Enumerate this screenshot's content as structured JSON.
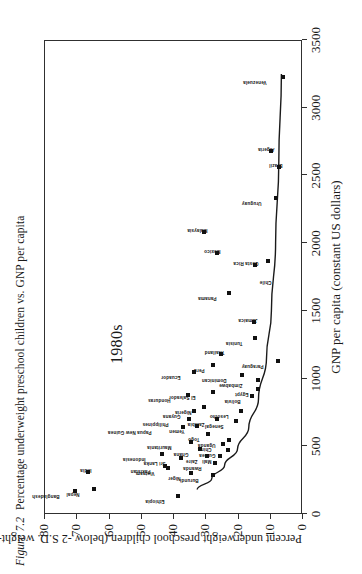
{
  "figure": {
    "number": "Figure 7.2",
    "caption": "Percentage underweight preschool children vs. GNP per capita"
  },
  "chart_data": {
    "type": "scatter",
    "title": "Percentage underweight preschool children vs. GNP per capita",
    "annotation": "1980s",
    "xlabel": "GNP per capita (constant US dollars)",
    "ylabel": "Percent underweight preschool children (below -2 S.D. weight-for-age)",
    "xlim": [
      0,
      3500
    ],
    "ylim": [
      0,
      80
    ],
    "xticks": [
      "0",
      "500",
      "1000",
      "1500",
      "2000",
      "2500",
      "3000",
      "3500"
    ],
    "yticks": [
      "0",
      "10",
      "20",
      "30",
      "40",
      "50",
      "60",
      "70",
      "80"
    ],
    "grid": false,
    "legend": "none",
    "trend_line": {
      "description": "fitted declining curve",
      "points": [
        [
          180,
          32.5
        ],
        [
          260,
          28
        ],
        [
          360,
          24
        ],
        [
          480,
          20
        ],
        [
          640,
          16.5
        ],
        [
          850,
          13.5
        ],
        [
          1150,
          11
        ],
        [
          1500,
          9.5
        ],
        [
          2000,
          8.2
        ],
        [
          2600,
          7.2
        ],
        [
          3250,
          6.4
        ]
      ]
    },
    "points": [
      {
        "name": "Bangladesh",
        "x": 170,
        "y": 70.5,
        "lx": -2,
        "ly": -20,
        "rot": -90
      },
      {
        "name": "Nepal",
        "x": 185,
        "y": 64.5,
        "lx": -2,
        "ly": -19,
        "rot": -90
      },
      {
        "name": "India",
        "x": 310,
        "y": 66.5,
        "lx": 5,
        "ly": -1,
        "rot": -90
      },
      {
        "name": "Pakistan",
        "x": 355,
        "y": 42.5,
        "lx": -2,
        "ly": -19,
        "rot": -90
      },
      {
        "name": "Indonesia",
        "x": 440,
        "y": 43.5,
        "lx": -2,
        "ly": -21,
        "rot": -90
      },
      {
        "name": "Ethiopia",
        "x": 130,
        "y": 38.5,
        "lx": -2,
        "ly": -18,
        "rot": -90
      },
      {
        "name": "Niger",
        "x": 305,
        "y": 34.5,
        "lx": -2,
        "ly": -15,
        "rot": -90
      },
      {
        "name": "Sri Lanka",
        "x": 415,
        "y": 37.5,
        "lx": -2,
        "ly": -20,
        "rot": -90
      },
      {
        "name": "Vietnam",
        "x": 340,
        "y": 41.5,
        "lx": -2,
        "ly": -18,
        "rot": -90
      },
      {
        "name": "Papua New Guinea",
        "x": 640,
        "y": 37.0,
        "lx": -2,
        "ly": -36,
        "rot": -90
      },
      {
        "name": "Philippines",
        "x": 700,
        "y": 35.0,
        "lx": -2,
        "ly": -25,
        "rot": -90
      },
      {
        "name": "Mauritania",
        "x": 530,
        "y": 34.5,
        "lx": -2,
        "ly": -24,
        "rot": -90
      },
      {
        "name": "Ghana",
        "x": 480,
        "y": 31.5,
        "lx": -2,
        "ly": -16,
        "rot": -90
      },
      {
        "name": "Zaire",
        "x": 430,
        "y": 29.5,
        "lx": -2,
        "ly": -14,
        "rot": -90
      },
      {
        "name": "Burundi",
        "x": 285,
        "y": 27.5,
        "lx": -2,
        "ly": -19,
        "rot": -90
      },
      {
        "name": "Rwanda",
        "x": 380,
        "y": 27.0,
        "lx": -2,
        "ly": -18,
        "rot": -90
      },
      {
        "name": "Mali",
        "x": 430,
        "y": 25.5,
        "lx": -2,
        "ly": -13,
        "rot": -90
      },
      {
        "name": "Guinea",
        "x": 470,
        "y": 23.0,
        "lx": -2,
        "ly": -17,
        "rot": -90
      },
      {
        "name": "China",
        "x": 520,
        "y": 24.5,
        "lx": -2,
        "ly": -16,
        "rot": -90
      },
      {
        "name": "Uganda",
        "x": 545,
        "y": 22.5,
        "lx": -2,
        "ly": -18,
        "rot": -90
      },
      {
        "name": "Yemen",
        "x": 650,
        "y": 32.5,
        "lx": -2,
        "ly": -17,
        "rot": -90
      },
      {
        "name": "Togo",
        "x": 590,
        "y": 29.0,
        "lx": -2,
        "ly": -13,
        "rot": -90
      },
      {
        "name": "Guyana",
        "x": 760,
        "y": 33.5,
        "lx": -2,
        "ly": -18,
        "rot": -90
      },
      {
        "name": "Honduras",
        "x": 880,
        "y": 35.5,
        "lx": -2,
        "ly": -22,
        "rot": -90
      },
      {
        "name": "Nigeria",
        "x": 790,
        "y": 30.5,
        "lx": -2,
        "ly": -17,
        "rot": -90
      },
      {
        "name": "Zambia",
        "x": 700,
        "y": 26.5,
        "lx": -2,
        "ly": -17,
        "rot": -90
      },
      {
        "name": "Senegal",
        "x": 690,
        "y": 20.5,
        "lx": -2,
        "ly": -17,
        "rot": -90
      },
      {
        "name": "Lesotho",
        "x": 760,
        "y": 19.0,
        "lx": -2,
        "ly": -17,
        "rot": -90
      },
      {
        "name": "El Salvador",
        "x": 900,
        "y": 27.5,
        "lx": -2,
        "ly": -22,
        "rot": -90
      },
      {
        "name": "Bolivia",
        "x": 870,
        "y": 15.5,
        "lx": -2,
        "ly": -16,
        "rot": -90
      },
      {
        "name": "Egypt",
        "x": 920,
        "y": 13.5,
        "lx": -2,
        "ly": -14,
        "rot": -90
      },
      {
        "name": "Zimbabwe",
        "x": 990,
        "y": 13.5,
        "lx": -2,
        "ly": -20,
        "rot": -90
      },
      {
        "name": "Dominican",
        "x": 1030,
        "y": 18.5,
        "lx": -2,
        "ly": -20,
        "rot": -90
      },
      {
        "name": "Ecuador",
        "x": 1050,
        "y": 33.5,
        "lx": -2,
        "ly": -18,
        "rot": -90
      },
      {
        "name": "Peru",
        "x": 1100,
        "y": 27.5,
        "lx": -2,
        "ly": -13,
        "rot": -90
      },
      {
        "name": "Thailand",
        "x": 1180,
        "y": 25.0,
        "lx": 5,
        "ly": -1,
        "rot": -90
      },
      {
        "name": "Tunisia",
        "x": 1300,
        "y": 14.5,
        "lx": -2,
        "ly": -17,
        "rot": -90
      },
      {
        "name": "Jamaica",
        "x": 1420,
        "y": 15.0,
        "lx": 5,
        "ly": -1,
        "rot": -90
      },
      {
        "name": "Paraguay",
        "x": 1130,
        "y": 7.5,
        "lx": -2,
        "ly": -19,
        "rot": -90
      },
      {
        "name": "Panama",
        "x": 1630,
        "y": 22.5,
        "lx": -2,
        "ly": -17,
        "rot": -90
      },
      {
        "name": "Costa Rica",
        "x": 1840,
        "y": 14.5,
        "lx": 5,
        "ly": -1,
        "rot": -90
      },
      {
        "name": "Chile",
        "x": 1870,
        "y": 10.5,
        "lx": -18,
        "ly": -1,
        "rot": -90
      },
      {
        "name": "Mexico",
        "x": 1930,
        "y": 26.5,
        "lx": 5,
        "ly": -1,
        "rot": -90
      },
      {
        "name": "Malaysia",
        "x": 2080,
        "y": 30.5,
        "lx": 5,
        "ly": -1,
        "rot": -90
      },
      {
        "name": "Uruguay",
        "x": 2330,
        "y": 8.0,
        "lx": -2,
        "ly": -19,
        "rot": -90
      },
      {
        "name": "Brazil",
        "x": 2560,
        "y": 7.0,
        "lx": 5,
        "ly": -1,
        "rot": -90
      },
      {
        "name": "Algeria",
        "x": 2680,
        "y": 9.5,
        "lx": 5,
        "ly": -1,
        "rot": -90
      },
      {
        "name": "Venezuela",
        "x": 3230,
        "y": 6.0,
        "lx": -2,
        "ly": -21,
        "rot": -90
      }
    ]
  }
}
